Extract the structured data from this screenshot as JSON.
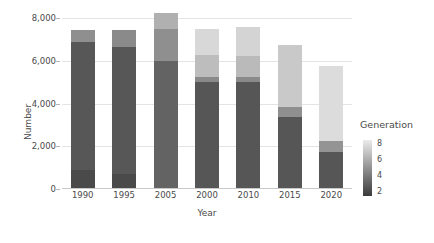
{
  "chart_data": {
    "type": "bar",
    "title": "",
    "subtitle": "",
    "xlabel": "Year",
    "ylabel": "Number",
    "stacked": true,
    "grid": true,
    "ylim": [
      0,
      8000
    ],
    "yticks": [
      0,
      2000,
      4000,
      6000,
      8000
    ],
    "ytick_labels": [
      "0",
      "2,000",
      "4,000",
      "6,000",
      "8,000"
    ],
    "categories": [
      "1990",
      "1995",
      "2005",
      "2000",
      "2010",
      "2015",
      "2020"
    ],
    "totals": [
      7450,
      7450,
      8250,
      7500,
      7600,
      6750,
      5750
    ],
    "legend": {
      "title": "Generation",
      "position": "right",
      "style": "continuous-colorbar",
      "ticks": [
        2,
        4,
        6,
        8
      ],
      "tick_labels": [
        "2",
        "4",
        "6",
        "8"
      ],
      "low_color": "#3b3b3b",
      "high_color": "#ebebeb"
    },
    "series": [
      {
        "name": "2",
        "color": "#4a4a4a",
        "values": [
          900,
          700,
          6000,
          5000,
          5000,
          3350,
          1750
        ]
      },
      {
        "name": "3",
        "color": "#575757",
        "values": [
          6000,
          5950,
          0,
          0,
          0,
          0,
          0
        ]
      },
      {
        "name": "4",
        "color": "#7a7a7a",
        "values": [
          0,
          0,
          0,
          250,
          250,
          500,
          500
        ]
      },
      {
        "name": "5",
        "color": "#9a9a9a",
        "values": [
          550,
          800,
          1500,
          0,
          0,
          0,
          0
        ]
      },
      {
        "name": "6",
        "color": "#b4b4b4",
        "values": [
          0,
          0,
          750,
          1000,
          950,
          2900,
          0
        ]
      },
      {
        "name": "7",
        "color": "#d2d2d2",
        "values": [
          0,
          0,
          0,
          1250,
          1400,
          0,
          3500
        ]
      }
    ],
    "bars": [
      {
        "category": "1990",
        "total": 7450,
        "segments": [
          {
            "generation": "2",
            "value": 900,
            "color": "#4a4a4a"
          },
          {
            "generation": "3",
            "value": 6000,
            "color": "#575757"
          },
          {
            "generation": "5",
            "value": 550,
            "color": "#8f8f8f"
          }
        ]
      },
      {
        "category": "1995",
        "total": 7450,
        "segments": [
          {
            "generation": "2",
            "value": 700,
            "color": "#4a4a4a"
          },
          {
            "generation": "3",
            "value": 5950,
            "color": "#575757"
          },
          {
            "generation": "5",
            "value": 800,
            "color": "#8a8a8a"
          }
        ]
      },
      {
        "category": "2005",
        "total": 8250,
        "segments": [
          {
            "generation": "2",
            "value": 6000,
            "color": "#636363"
          },
          {
            "generation": "5",
            "value": 1500,
            "color": "#8f8f8f"
          },
          {
            "generation": "6",
            "value": 750,
            "color": "#b0b0b0"
          }
        ]
      },
      {
        "category": "2000",
        "total": 7500,
        "segments": [
          {
            "generation": "2",
            "value": 5000,
            "color": "#565656"
          },
          {
            "generation": "4",
            "value": 250,
            "color": "#8a8a8a"
          },
          {
            "generation": "6",
            "value": 1000,
            "color": "#bdbdbd"
          },
          {
            "generation": "7",
            "value": 1250,
            "color": "#d8d8d8"
          }
        ]
      },
      {
        "category": "2010",
        "total": 7600,
        "segments": [
          {
            "generation": "2",
            "value": 5000,
            "color": "#565656"
          },
          {
            "generation": "4",
            "value": 250,
            "color": "#8a8a8a"
          },
          {
            "generation": "6",
            "value": 950,
            "color": "#bababa"
          },
          {
            "generation": "7",
            "value": 1400,
            "color": "#d4d4d4"
          }
        ]
      },
      {
        "category": "2015",
        "total": 6750,
        "segments": [
          {
            "generation": "2",
            "value": 3350,
            "color": "#565656"
          },
          {
            "generation": "4",
            "value": 500,
            "color": "#8f8f8f"
          },
          {
            "generation": "6",
            "value": 2900,
            "color": "#c9c9c9"
          }
        ]
      },
      {
        "category": "2020",
        "total": 5750,
        "segments": [
          {
            "generation": "2",
            "value": 1750,
            "color": "#565656"
          },
          {
            "generation": "4",
            "value": 500,
            "color": "#949494"
          },
          {
            "generation": "7",
            "value": 3500,
            "color": "#dcdcdc"
          }
        ]
      }
    ]
  }
}
